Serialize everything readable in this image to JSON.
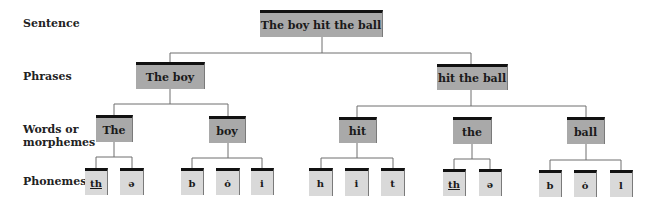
{
  "levels": {
    "sentence": "Sentence",
    "phrases": "Phrases",
    "words_line1": "Words or",
    "words_line2": "morphemes",
    "phonemes": "Phonemes"
  },
  "sentence": {
    "text": "The boy hit the ball"
  },
  "phrases": [
    {
      "text": "The boy"
    },
    {
      "text": "hit the ball"
    }
  ],
  "words": [
    {
      "text": "The"
    },
    {
      "text": "boy"
    },
    {
      "text": "hit"
    },
    {
      "text": "the"
    },
    {
      "text": "ball"
    }
  ],
  "phonemes": [
    {
      "text": "th",
      "underlined": true,
      "word": "The"
    },
    {
      "text": "ə",
      "word": "The"
    },
    {
      "text": "b",
      "word": "boy"
    },
    {
      "text": "ȯ",
      "word": "boy"
    },
    {
      "text": "i",
      "word": "boy"
    },
    {
      "text": "h",
      "word": "hit"
    },
    {
      "text": "i",
      "word": "hit"
    },
    {
      "text": "t",
      "word": "hit"
    },
    {
      "text": "th",
      "underlined": true,
      "word": "the"
    },
    {
      "text": "ə",
      "word": "the"
    },
    {
      "text": "b",
      "word": "ball"
    },
    {
      "text": "ȯ",
      "word": "ball"
    },
    {
      "text": "l",
      "word": "ball"
    }
  ],
  "colors": {
    "node_dark": "#a9a9a9",
    "node_light": "#d9d9d9",
    "node_top_bar": "#111111",
    "connector": "#6e6e6e"
  }
}
